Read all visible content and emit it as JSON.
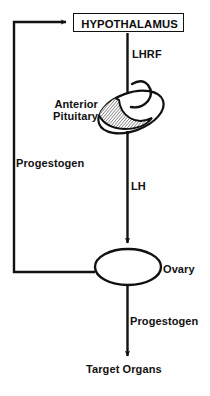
{
  "diagram": {
    "type": "flow-diagram",
    "background_color": "#fefefe",
    "line_color": "#111111",
    "text_color": "#111111",
    "nodes": {
      "hypothalamus": {
        "label": "HYPOTHALAMUS",
        "shape": "rectangle",
        "x": 73,
        "y": 13,
        "w": 111,
        "h": 19
      },
      "anterior_pituitary": {
        "label": "Anterior\nPituitary",
        "label_line1": "Anterior",
        "label_line2": "Pituitary",
        "shape": "hatched-ellipse-with-stalk",
        "cx": 131,
        "cy": 112
      },
      "ovary": {
        "label": "Ovary",
        "shape": "ellipse",
        "cx": 128,
        "cy": 267,
        "rx": 33,
        "ry": 18
      },
      "target_organs": {
        "label": "Target Organs",
        "shape": "text",
        "cx": 128,
        "cy": 371
      }
    },
    "edges": [
      {
        "name": "lhrf-arrow",
        "label": "LHRF",
        "from": "hypothalamus",
        "to": "anterior_pituitary",
        "direction": "down"
      },
      {
        "name": "lh-arrow",
        "label": "LH",
        "from": "anterior_pituitary",
        "to": "ovary",
        "direction": "down"
      },
      {
        "name": "progestogen-output-arrow",
        "label": "Progestogen",
        "from": "ovary",
        "to": "target_organs",
        "direction": "down"
      },
      {
        "name": "progestogen-feedback-arrow",
        "label": "Progestogen",
        "from": "ovary",
        "to": "hypothalamus",
        "direction": "left-up-right",
        "feedback": true
      }
    ]
  }
}
